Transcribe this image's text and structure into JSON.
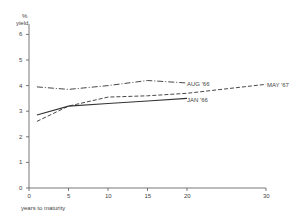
{
  "chart_data": {
    "type": "line",
    "title": "",
    "ylabel": "% yield",
    "xlabel": "years to maturity",
    "ylim": [
      0,
      6
    ],
    "xlim": [
      0,
      30
    ],
    "yticks": [
      "0",
      "1",
      "2",
      "3",
      "4",
      "5",
      "6"
    ],
    "xticks": [
      "0",
      "5",
      "10",
      "15",
      "20",
      "30"
    ],
    "grid": false,
    "series": [
      {
        "name": "AUG '66",
        "style": "dash-dot",
        "x": [
          1,
          5,
          10,
          15,
          20
        ],
        "y": [
          3.95,
          3.85,
          4.0,
          4.2,
          4.1
        ]
      },
      {
        "name": "MAY '67",
        "style": "dashed",
        "x": [
          1,
          5,
          10,
          15,
          20,
          30
        ],
        "y": [
          2.6,
          3.2,
          3.55,
          3.6,
          3.7,
          4.05
        ]
      },
      {
        "name": "JAN '66",
        "style": "solid",
        "x": [
          1,
          5,
          10,
          15,
          20
        ],
        "y": [
          2.85,
          3.2,
          3.3,
          3.4,
          3.5
        ]
      }
    ]
  },
  "labels": {
    "y_unit": "%",
    "y_name": "yield",
    "x_name": "years to maturity",
    "aug": "AUG '66",
    "may": "MAY '67",
    "jan": "JAN '66"
  }
}
